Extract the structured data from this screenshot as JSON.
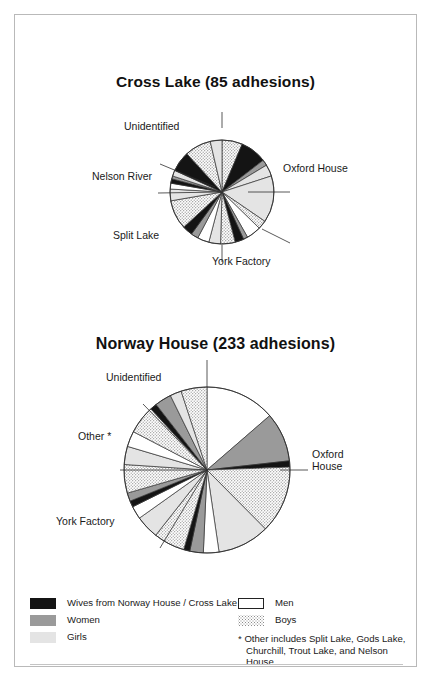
{
  "page": {
    "border_color": "#b9b9b9",
    "background": "#ffffff"
  },
  "charts": [
    {
      "id": "cross-lake",
      "title": "Cross Lake (85 adhesions)",
      "labels": [
        {
          "name": "Unidentified",
          "text": "Unidentified"
        },
        {
          "name": "Nelson River",
          "text": "Nelson River"
        },
        {
          "name": "Split Lake",
          "text": "Split Lake"
        },
        {
          "name": "York Factory",
          "text": "York Factory"
        },
        {
          "name": "Oxford House",
          "text": "Oxford House"
        }
      ]
    },
    {
      "id": "norway-house",
      "title": "Norway House (233 adhesions)",
      "labels": [
        {
          "name": "Unidentified",
          "text": "Unidentified"
        },
        {
          "name": "Other",
          "text": "Other *"
        },
        {
          "name": "York Factory",
          "text": "York Factory"
        },
        {
          "name": "Oxford House line 1",
          "text": "Oxford"
        },
        {
          "name": "Oxford House line 2",
          "text": "House"
        }
      ]
    }
  ],
  "legend": {
    "items": [
      {
        "swatch": "black",
        "label": "Wives from Norway House / Cross Lake",
        "color": "#141414"
      },
      {
        "swatch": "white-outline",
        "label": "Men",
        "color": "#ffffff"
      },
      {
        "swatch": "gray",
        "label": "Women",
        "color": "#9a9a9a"
      },
      {
        "swatch": "dotted",
        "label": "Boys",
        "color": "#8c8c8c"
      },
      {
        "swatch": "light-gray",
        "label": "Girls",
        "color": "#e4e4e4"
      }
    ],
    "footnote_line1": "* Other includes Split Lake, Gods Lake,",
    "footnote_line2": "Churchill, Trout Lake, and Nelson House."
  },
  "chart_data": [
    {
      "type": "pie",
      "title": "Cross Lake (85 adhesions)",
      "total": 85,
      "units": "adhesions",
      "legend_position": "bottom",
      "center": [
        222,
        192
      ],
      "radius": 52,
      "start_angle_deg": -90,
      "groups": [
        "Oxford House",
        "York Factory",
        "Split Lake",
        "Nelson River",
        "Unidentified"
      ],
      "categories": [
        "Men",
        "Women",
        "Boys",
        "Girls",
        "Wives from Norway House / Cross Lake"
      ],
      "slices": [
        {
          "group": "Oxford House",
          "category": "Boys",
          "value": 7.0,
          "fill": "dotted"
        },
        {
          "group": "Oxford House",
          "category": "Wives",
          "value": 9.0,
          "fill": "black"
        },
        {
          "group": "Oxford House",
          "category": "Women",
          "value": 2.0,
          "fill": "gray"
        },
        {
          "group": "Oxford House",
          "category": "Girls",
          "value": 4.0,
          "fill": "light-gray"
        },
        {
          "group": "Oxford House",
          "category": "Men",
          "value": 16.0,
          "fill": "light-gray"
        },
        {
          "group": "Oxford House",
          "category": "Boys2",
          "value": 3.0,
          "fill": "dotted"
        },
        {
          "group": "York Factory",
          "category": "Men",
          "value": 5.0,
          "fill": "white"
        },
        {
          "group": "York Factory",
          "category": "Women",
          "value": 1.5,
          "fill": "gray"
        },
        {
          "group": "York Factory",
          "category": "Wives",
          "value": 3.0,
          "fill": "black"
        },
        {
          "group": "York Factory",
          "category": "Boys",
          "value": 5.0,
          "fill": "dotted"
        },
        {
          "group": "York Factory",
          "category": "Girls",
          "value": 4.0,
          "fill": "light-gray"
        },
        {
          "group": "Split Lake",
          "category": "Men",
          "value": 4.0,
          "fill": "white"
        },
        {
          "group": "Split Lake",
          "category": "Women",
          "value": 2.5,
          "fill": "gray"
        },
        {
          "group": "Split Lake",
          "category": "Wives",
          "value": 3.5,
          "fill": "black"
        },
        {
          "group": "Split Lake",
          "category": "Boys",
          "value": 10.0,
          "fill": "dotted"
        },
        {
          "group": "Nelson River",
          "category": "Girls",
          "value": 4.0,
          "fill": "light-gray"
        },
        {
          "group": "Nelson River",
          "category": "Men",
          "value": 2.0,
          "fill": "white"
        },
        {
          "group": "Nelson River",
          "category": "Wives",
          "value": 1.5,
          "fill": "black"
        },
        {
          "group": "Nelson River",
          "category": "Women",
          "value": 1.0,
          "fill": "gray"
        },
        {
          "group": "Unidentified",
          "category": "Girls",
          "value": 2.0,
          "fill": "light-gray"
        },
        {
          "group": "Unidentified",
          "category": "Wives",
          "value": 7.0,
          "fill": "black"
        },
        {
          "group": "Unidentified",
          "category": "Boys",
          "value": 9.0,
          "fill": "dotted"
        },
        {
          "group": "Unidentified",
          "category": "Girls2",
          "value": 4.0,
          "fill": "light-gray"
        }
      ]
    },
    {
      "type": "pie",
      "title": "Norway House (233 adhesions)",
      "total": 233,
      "units": "adhesions",
      "legend_position": "bottom",
      "center": [
        207,
        470
      ],
      "radius": 83,
      "start_angle_deg": -90,
      "groups": [
        "Oxford House",
        "York Factory",
        "Other",
        "Unidentified"
      ],
      "categories": [
        "Men",
        "Women",
        "Boys",
        "Girls",
        "Wives from Norway House / Cross Lake"
      ],
      "slices": [
        {
          "group": "Oxford House",
          "category": "Men",
          "value": 13.5,
          "fill": "white"
        },
        {
          "group": "Oxford House",
          "category": "Women",
          "value": 9.5,
          "fill": "gray"
        },
        {
          "group": "Oxford House",
          "category": "Wives",
          "value": 1.2,
          "fill": "black"
        },
        {
          "group": "Oxford House",
          "category": "Boys",
          "value": 13.0,
          "fill": "dotted"
        },
        {
          "group": "York Factory",
          "category": "Girls",
          "value": 10.0,
          "fill": "light-gray"
        },
        {
          "group": "York Factory",
          "category": "Men",
          "value": 3.0,
          "fill": "white"
        },
        {
          "group": "York Factory",
          "category": "Women",
          "value": 2.6,
          "fill": "gray"
        },
        {
          "group": "York Factory",
          "category": "Wives",
          "value": 1.2,
          "fill": "black"
        },
        {
          "group": "York Factory",
          "category": "Boys",
          "value": 6.0,
          "fill": "dotted"
        },
        {
          "group": "Other",
          "category": "Girls",
          "value": 4.5,
          "fill": "light-gray"
        },
        {
          "group": "Other",
          "category": "Men",
          "value": 2.5,
          "fill": "white"
        },
        {
          "group": "Other",
          "category": "Wives",
          "value": 1.2,
          "fill": "black"
        },
        {
          "group": "Other",
          "category": "Women",
          "value": 1.6,
          "fill": "gray"
        },
        {
          "group": "Other",
          "category": "Boys",
          "value": 5.5,
          "fill": "dotted"
        },
        {
          "group": "Other",
          "category": "Girls2",
          "value": 3.5,
          "fill": "light-gray"
        },
        {
          "group": "Unidentified",
          "category": "Men",
          "value": 3.0,
          "fill": "white"
        },
        {
          "group": "Unidentified",
          "category": "Boys",
          "value": 5.5,
          "fill": "dotted"
        },
        {
          "group": "Unidentified",
          "category": "Wives",
          "value": 1.3,
          "fill": "black"
        },
        {
          "group": "Unidentified",
          "category": "Women",
          "value": 3.2,
          "fill": "gray"
        },
        {
          "group": "Unidentified",
          "category": "Girls",
          "value": 2.2,
          "fill": "light-gray"
        },
        {
          "group": "Unidentified",
          "category": "Boys2",
          "value": 5.0,
          "fill": "dotted"
        }
      ]
    }
  ]
}
